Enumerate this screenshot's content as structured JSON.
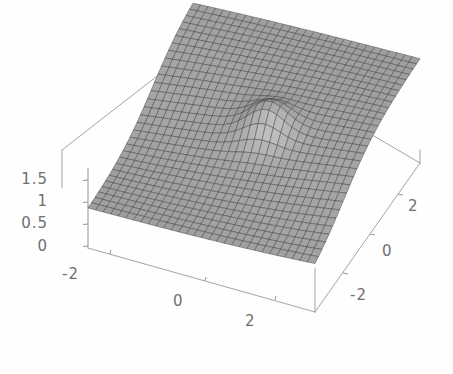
{
  "figure": {
    "kind": "3d-surface-plot",
    "title": "",
    "background_color": "#fefefe",
    "frame_color": "#8a8a8a",
    "mesh_line_color": "#3c3c3c",
    "surface_light_color": "#b4b4b4",
    "surface_dark_color": "#6e6e6e"
  },
  "axes": {
    "x": {
      "label": "",
      "ticks": [
        "-2",
        "0",
        "2"
      ],
      "range": [
        -3,
        3
      ]
    },
    "y": {
      "label": "",
      "ticks": [
        "2",
        "0",
        "-2"
      ],
      "range": [
        -3,
        3
      ]
    },
    "z": {
      "label": "",
      "ticks": [
        "1.5",
        "1",
        "0.5",
        "0"
      ],
      "range": [
        0,
        1.75
      ]
    }
  },
  "chart_data": {
    "type": "surface",
    "title": "",
    "xlabel": "",
    "ylabel": "",
    "zlabel": "",
    "xlim": [
      -3,
      3
    ],
    "ylim": [
      -3,
      3
    ],
    "zlim": [
      0,
      1.75
    ],
    "xticks": [
      -2,
      0,
      2
    ],
    "yticks": [
      -2,
      0,
      2
    ],
    "zticks": [
      0,
      0.5,
      1,
      1.5
    ],
    "grid": true,
    "legend": "none",
    "mesh_nx": 31,
    "mesh_ny": 31,
    "surface_features": [
      {
        "name": "low-plateau",
        "region": "front-left",
        "z": 0.5
      },
      {
        "name": "high-plateau",
        "region": "back-right",
        "z": 1.3
      },
      {
        "name": "step-ridge",
        "orientation": "diagonal",
        "z_mid": 0.9
      },
      {
        "name": "center-bump",
        "x": 0.2,
        "y": 0.0,
        "z": 1.0
      }
    ],
    "z_values_sample": {
      "corner_front_left": 0.5,
      "corner_front_right": 0.5,
      "corner_back_left": 0.55,
      "corner_back_right": 1.3,
      "center": 0.95
    }
  },
  "tick_labels": {
    "z": [
      {
        "text": "1.5",
        "x": 20,
        "y": 172
      },
      {
        "text": "1",
        "x": 50,
        "y": 194
      },
      {
        "text": "0.5",
        "x": 20,
        "y": 216
      },
      {
        "text": "0",
        "x": 50,
        "y": 240
      }
    ],
    "x_front": [
      {
        "text": "-2",
        "x": 60,
        "y": 268
      },
      {
        "text": "0",
        "x": 170,
        "y": 294
      },
      {
        "text": "2",
        "x": 258,
        "y": 316
      }
    ],
    "y_right": [
      {
        "text": "2",
        "x": 408,
        "y": 203
      },
      {
        "text": "0",
        "x": 385,
        "y": 252
      },
      {
        "text": "-2",
        "x": 352,
        "y": 303
      }
    ]
  }
}
